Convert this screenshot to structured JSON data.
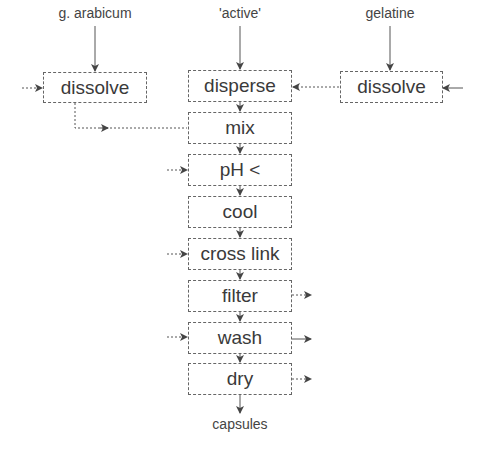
{
  "inputs": {
    "left": "g. arabicum",
    "center": "'active'",
    "right": "gelatine"
  },
  "boxes": {
    "dissolve_left": "dissolve",
    "disperse": "disperse",
    "dissolve_right": "dissolve",
    "mix": "mix",
    "ph": "pH <",
    "cool": "cool",
    "cross_link": "cross link",
    "filter": "filter",
    "wash": "wash",
    "dry": "dry"
  },
  "output": "capsules"
}
